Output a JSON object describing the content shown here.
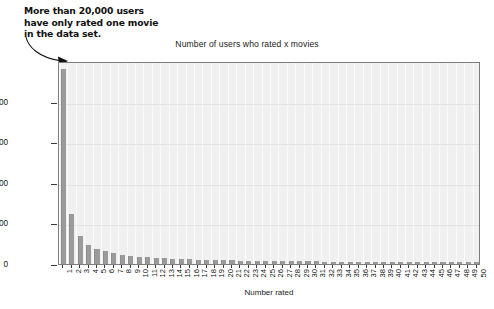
{
  "chart_data": {
    "type": "bar",
    "title": "Number of users who rated x movies",
    "xlabel": "Number rated",
    "ylabel": "Number of users rated that amount",
    "categories": [
      "1",
      "2",
      "3",
      "4",
      "5",
      "6",
      "7",
      "8",
      "9",
      "10",
      "11",
      "12",
      "13",
      "14",
      "15",
      "16",
      "17",
      "18",
      "19",
      "20",
      "21",
      "22",
      "23",
      "24",
      "25",
      "26",
      "27",
      "28",
      "29",
      "30",
      "31",
      "32",
      "33",
      "34",
      "35",
      "36",
      "37",
      "38",
      "39",
      "40",
      "41",
      "42",
      "43",
      "44",
      "45",
      "46",
      "47",
      "48",
      "49",
      "50"
    ],
    "values": [
      24000,
      6200,
      3500,
      2400,
      1900,
      1550,
      1300,
      1150,
      1000,
      900,
      820,
      760,
      700,
      650,
      610,
      570,
      540,
      510,
      485,
      460,
      440,
      420,
      405,
      390,
      375,
      360,
      350,
      340,
      330,
      320,
      312,
      304,
      296,
      289,
      282,
      276,
      270,
      264,
      258,
      253,
      248,
      243,
      238,
      234,
      230,
      226,
      222,
      218,
      214,
      210
    ],
    "ylim": [
      0,
      25000
    ],
    "yticks": [
      0,
      5000,
      10000,
      15000,
      20000
    ],
    "ytick_labels": [
      "0",
      "5,000",
      "10,000",
      "15,000",
      "20,000"
    ],
    "grid": true,
    "legend": "none",
    "bar_color": "#9b9b9b",
    "plot_background": "#f0f0f0",
    "annotations": [
      {
        "id": "annotation-1",
        "text": "More than 20,000 users\nhave only rated one movie\nin the data set.",
        "points_to_category": "1"
      },
      {
        "id": "annotation-2",
        "text": "More than 5,000 users have\nonly rated two movie in the\ndata set.",
        "points_to_category": "2"
      }
    ]
  }
}
